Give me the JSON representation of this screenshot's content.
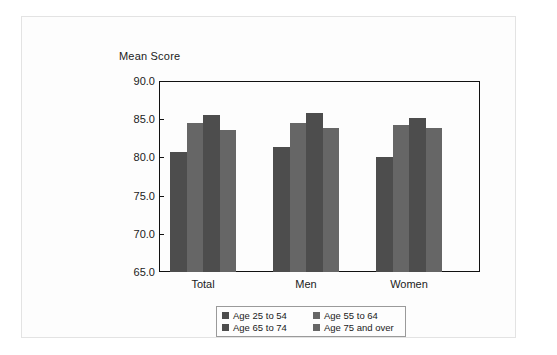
{
  "chart_data": {
    "type": "bar",
    "title": "",
    "ylabel": "Mean Score",
    "xlabel": "",
    "categories": [
      "Total",
      "Men",
      "Women"
    ],
    "series": [
      {
        "name": "Age 25 to 54",
        "values": [
          80.7,
          81.4,
          80.0
        ],
        "color": "#4d4d4d"
      },
      {
        "name": "Age 55 to 64",
        "values": [
          84.5,
          84.5,
          84.3
        ],
        "color": "#666666"
      },
      {
        "name": "Age 65 to 74",
        "values": [
          85.5,
          85.8,
          85.2
        ],
        "color": "#4d4d4d"
      },
      {
        "name": "Age 75 and over",
        "values": [
          83.6,
          83.8,
          83.9
        ],
        "color": "#666666"
      }
    ],
    "ylim": [
      65.0,
      90.0
    ],
    "yticks": [
      "65.0",
      "70.0",
      "75.0",
      "80.0",
      "85.0",
      "90.0"
    ],
    "ytick_values": [
      65.0,
      70.0,
      75.0,
      80.0,
      85.0,
      90.0
    ],
    "grid": false,
    "legend_position": "bottom",
    "frame_color": "#111111"
  },
  "axis": {
    "y_title": "Mean Score"
  },
  "legend": {
    "items": [
      {
        "label": "Age 25 to 54",
        "color": "#4d4d4d"
      },
      {
        "label": "Age 55 to 64",
        "color": "#666666"
      },
      {
        "label": "Age 65 to 74",
        "color": "#4d4d4d"
      },
      {
        "label": "Age 75 and over",
        "color": "#666666"
      }
    ]
  }
}
